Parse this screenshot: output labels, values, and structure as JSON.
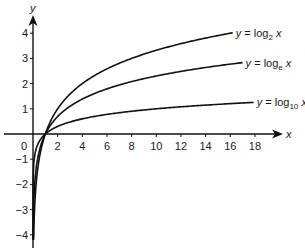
{
  "chart_data": {
    "type": "line",
    "title": "",
    "xlabel": "x",
    "ylabel": "y",
    "xlim": [
      -1,
      20
    ],
    "ylim": [
      -4.5,
      4.5
    ],
    "grid": false,
    "x_ticks": [
      2,
      4,
      6,
      8,
      10,
      12,
      14,
      16,
      18
    ],
    "y_ticks": [
      -4,
      -3,
      -2,
      -1,
      1,
      2,
      3,
      4
    ],
    "origin_label": "0",
    "series": [
      {
        "name": "y = log2 x",
        "base": 2,
        "label_prefix": "y = log",
        "label_sub": "2",
        "label_var": "x",
        "x_end": 16.2
      },
      {
        "name": "y = loge x",
        "base": 2.718281828,
        "label_prefix": "y = log",
        "label_sub": "e",
        "label_var": "x",
        "x_end": 17
      },
      {
        "name": "y = log10 x",
        "base": 10,
        "label_prefix": "y = log",
        "label_sub": "10",
        "label_var": "x",
        "x_end": 17.9
      }
    ],
    "annotations": [
      "Curves intersect at (1, 0)"
    ]
  },
  "layout": {
    "origin_px": [
      33,
      134
    ],
    "px_per_x": 12.33,
    "px_per_y": 25.2,
    "y_min_value": -4.2,
    "line_color": "#111111"
  }
}
